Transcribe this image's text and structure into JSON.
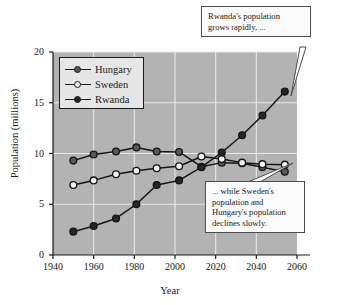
{
  "chart_data": {
    "type": "line",
    "title": "",
    "xlabel": "Year",
    "ylabel": "Population (millions)",
    "xlim": [
      1940,
      2060
    ],
    "ylim": [
      0,
      20
    ],
    "xticks": [
      1940,
      1960,
      1980,
      2000,
      2020,
      2040,
      2060
    ],
    "yticks": [
      0,
      5,
      10,
      15,
      20
    ],
    "grid": true,
    "legend_position": "top-left",
    "plot_background": "#b3b3b3",
    "series": [
      {
        "name": "Hungary",
        "marker": "filled-gray-circle",
        "color": "#595959",
        "x": [
          1950,
          1960,
          1971,
          1981,
          1991,
          2002,
          2013,
          2023,
          2033,
          2043,
          2054
        ],
        "values": [
          9.3,
          9.9,
          10.2,
          10.6,
          10.2,
          10.15,
          8.7,
          9.1,
          9.05,
          8.65,
          8.2
        ]
      },
      {
        "name": "Sweden",
        "marker": "open-circle",
        "color": "#f2f2f2",
        "x": [
          1950,
          1960,
          1971,
          1981,
          1991,
          2002,
          2013,
          2023,
          2033,
          2043,
          2054
        ],
        "values": [
          6.9,
          7.35,
          7.95,
          8.3,
          8.55,
          8.75,
          9.7,
          9.45,
          9.1,
          8.95,
          8.9
        ]
      },
      {
        "name": "Rwanda",
        "marker": "filled-dark-circle",
        "color": "#262626",
        "x": [
          1950,
          1960,
          1971,
          1981,
          1991,
          2002,
          2013,
          2023,
          2033,
          2043,
          2054
        ],
        "values": [
          2.3,
          2.85,
          3.6,
          5.0,
          6.9,
          7.35,
          8.65,
          10.1,
          11.8,
          13.75,
          16.1
        ]
      }
    ],
    "annotations": [
      {
        "name": "callout-rwanda",
        "lines": [
          "Rwanda's population",
          "grows rapidly, ..."
        ],
        "points_to": {
          "series": "Rwanda",
          "x": 2054,
          "y": 16.1
        }
      },
      {
        "name": "callout-decline",
        "lines": [
          "... while Sweden's",
          "population and",
          "Hungary's population",
          "declines slowly."
        ],
        "points_to": {
          "series": "Sweden",
          "x": 2054,
          "y": 8.9
        }
      }
    ]
  },
  "axes": {
    "ylabel": "Population (millions)",
    "xlabel": "Year",
    "yticks": [
      "0",
      "5",
      "10",
      "15",
      "20"
    ],
    "xticks": [
      "1940",
      "1960",
      "1980",
      "2000",
      "2020",
      "2040",
      "2060"
    ]
  },
  "legend": {
    "items": [
      {
        "label": "Hungary"
      },
      {
        "label": "Sweden"
      },
      {
        "label": "Rwanda"
      }
    ]
  },
  "callouts": {
    "rwanda": {
      "line1": "Rwanda's population",
      "line2": "grows rapidly, ..."
    },
    "decline": {
      "line1": "... while Sweden's",
      "line2": "population and",
      "line3": "Hungary's population",
      "line4": "declines slowly."
    }
  }
}
